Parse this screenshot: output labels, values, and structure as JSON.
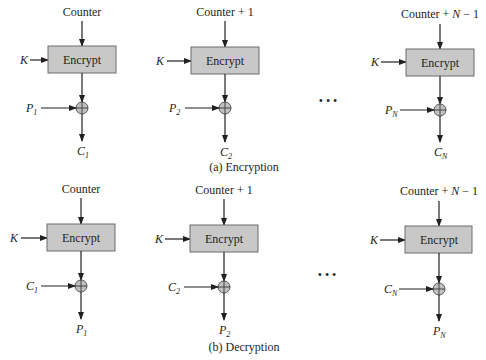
{
  "diagram": {
    "colors": {
      "box_fill": "#c8c8c8",
      "box_stroke": "#6d6d6d",
      "xor_fill": "#c0c0c0",
      "line": "#231f20"
    },
    "encryption": {
      "caption": "(a) Encryption",
      "stages": [
        {
          "counter": "Counter",
          "key": "K",
          "block": "Encrypt",
          "input": "P",
          "input_sub": "1",
          "output": "C",
          "output_sub": "1"
        },
        {
          "counter": "Counter + 1",
          "key": "K",
          "block": "Encrypt",
          "input": "P",
          "input_sub": "2",
          "output": "C",
          "output_sub": "2"
        },
        {
          "counter_prefix": "Counter + ",
          "counter_var": "N",
          "counter_suffix": " − 1",
          "key": "K",
          "block": "Encrypt",
          "input": "P",
          "input_sub": "N",
          "output": "C",
          "output_sub": "N"
        }
      ],
      "ellipsis": "• • •"
    },
    "decryption": {
      "caption": "(b) Decryption",
      "stages": [
        {
          "counter": "Counter",
          "key": "K",
          "block": "Encrypt",
          "input": "C",
          "input_sub": "1",
          "output": "P",
          "output_sub": "1"
        },
        {
          "counter": "Counter + 1",
          "key": "K",
          "block": "Encrypt",
          "input": "C",
          "input_sub": "2",
          "output": "P",
          "output_sub": "2"
        },
        {
          "counter_prefix": "Counter + ",
          "counter_var": "N",
          "counter_suffix": " − 1",
          "key": "K",
          "block": "Encrypt",
          "input": "C",
          "input_sub": "N",
          "output": "P",
          "output_sub": "N"
        }
      ],
      "ellipsis": "• • •"
    }
  }
}
